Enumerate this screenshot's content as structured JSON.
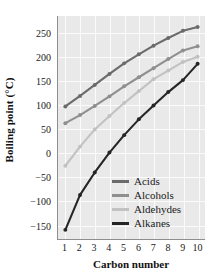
{
  "chart_data": {
    "type": "line",
    "title": "",
    "xlabel": "Carbon number",
    "ylabel": "Boiling point (°C)",
    "x": [
      1,
      2,
      3,
      4,
      5,
      6,
      7,
      8,
      9,
      10
    ],
    "xtick_labels": [
      "1",
      "2",
      "3",
      "4",
      "5",
      "6",
      "7",
      "8",
      "9",
      "10"
    ],
    "ytick_labels": [
      "250",
      "200",
      "150",
      "100",
      "50",
      "0",
      "−50",
      "−100",
      "−150"
    ],
    "ytick_values": [
      250,
      200,
      150,
      100,
      50,
      0,
      -50,
      -100,
      -150
    ],
    "xlim": [
      0.5,
      10.5
    ],
    "ylim": [
      -180,
      285
    ],
    "grid": true,
    "legend_position": "center-right inside plot",
    "panel_background": "#e9e9e9",
    "gridline_color": "#fbfbfb",
    "markers": "filled circles at each data point",
    "series": [
      {
        "name": "Acids",
        "color": "#6b6b6b",
        "values": [
          96,
          118,
          141,
          164,
          186,
          205,
          223,
          239,
          254,
          262
        ]
      },
      {
        "name": "Alcohols",
        "color": "#8f8f8f",
        "values": [
          61,
          78,
          97,
          117,
          138,
          157,
          176,
          195,
          213,
          222
        ]
      },
      {
        "name": "Aldehydes",
        "color": "#c2c2c2",
        "values": [
          -28,
          12,
          48,
          76,
          103,
          128,
          153,
          171,
          189,
          200
        ]
      },
      {
        "name": "Alkanes",
        "color": "#262626",
        "values": [
          -162,
          -89,
          -42,
          -0.5,
          36,
          69,
          98,
          126,
          151,
          185
        ]
      }
    ]
  }
}
